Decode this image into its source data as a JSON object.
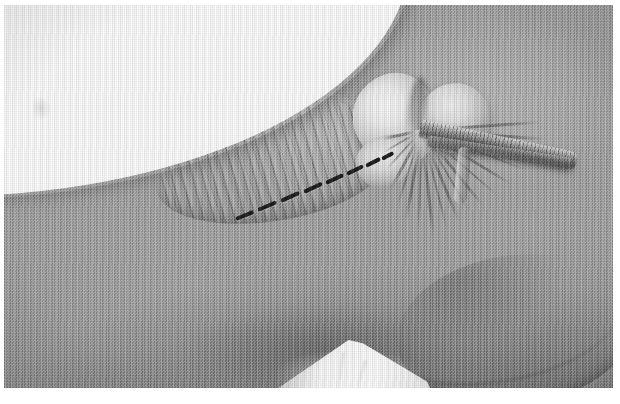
{
  "figure": {
    "domain": "Natural-Image",
    "caption_text": "",
    "orientation": "landscape",
    "rendering": "grayscale halftone print",
    "canvas": {
      "width": 620,
      "height": 404,
      "background": "#ffffff"
    },
    "plate": {
      "x": 4,
      "y": 5,
      "width": 609,
      "height": 383,
      "base_color": "#9d9d9d"
    }
  },
  "palette": {
    "paper_white": "#ffffff",
    "bone_highlight": "#fbfbfb",
    "tissue_light": "#c8c8c8",
    "tissue_mid": "#9d9d9d",
    "tissue_dark": "#6f6f6f",
    "shadow": "#4a4a4a",
    "incision_ink": "#1d1d1d",
    "drape_white": "#ffffff"
  },
  "regions": [
    {
      "name": "exposed-corner",
      "label": "blank white upper-left corner",
      "x": 0,
      "y": 0,
      "width": 330,
      "height": 225,
      "tone": "#ffffff"
    },
    {
      "name": "muscle-belly",
      "label": "striated muscle wing",
      "x": 150,
      "y": 74,
      "width": 230,
      "height": 120,
      "tone": "#a8a8a8",
      "feature": "parallel fiber striations running upper-left to lower-right"
    },
    {
      "name": "condyle-medial",
      "label": "bright bone condyle (left lobe)",
      "x": 349,
      "y": 68,
      "width": 84,
      "height": 92,
      "tone": "#fbfbfb"
    },
    {
      "name": "condyle-lateral",
      "label": "bright bone condyle (right lobe)",
      "x": 414,
      "y": 78,
      "width": 72,
      "height": 70,
      "tone": "#e2e2e2"
    },
    {
      "name": "intercondylar-notch",
      "label": "dark notch between condyles",
      "x": 404,
      "y": 72,
      "width": 18,
      "height": 62,
      "tone": "#565656"
    },
    {
      "name": "ligament-fan",
      "label": "radiating ligament fibers",
      "origin_x": 418,
      "origin_y": 124,
      "tone": "#5c5c5c"
    },
    {
      "name": "tendon-band",
      "label": "oblique tendon / graft strip",
      "x": 416,
      "y": 114,
      "width": 160,
      "height": 19,
      "tone": "#4a4a4a"
    },
    {
      "name": "lower-crease",
      "label": "sweeping curved shadow crease, lower right",
      "x": 372,
      "y": 244,
      "width": 250,
      "height": 132,
      "tone": "#4e4e4e"
    },
    {
      "name": "surgical-drape",
      "label": "white cloth drape peak at bottom",
      "x": 252,
      "y": 333,
      "width": 178,
      "height": 58,
      "peak_x": 345,
      "peak_y": 345,
      "tone": "#ffffff"
    }
  ],
  "incision": {
    "name": "dashed-incision-line",
    "label": "dashed surgical incision marker",
    "ink": "#1d1d1d",
    "start": {
      "x": 232,
      "y": 212
    },
    "end": {
      "x": 366,
      "y": 150
    },
    "dash_count": 8,
    "dash_length_px": 20,
    "dash_thickness_px": 4,
    "angle_deg": -25,
    "dashes": [
      {
        "x": 6,
        "y": 72,
        "angle": -22,
        "len": 19
      },
      {
        "x": 28,
        "y": 63,
        "angle": -23,
        "len": 20
      },
      {
        "x": 51,
        "y": 54,
        "angle": -24,
        "len": 20
      },
      {
        "x": 74,
        "y": 45,
        "angle": -25,
        "len": 20
      },
      {
        "x": 96,
        "y": 36,
        "angle": -25,
        "len": 19
      },
      {
        "x": 117,
        "y": 27,
        "angle": -26,
        "len": 18
      },
      {
        "x": 136,
        "y": 19,
        "angle": -27,
        "len": 16
      },
      {
        "x": 152,
        "y": 12,
        "angle": -28,
        "len": 13
      }
    ]
  },
  "fan_rays": [
    {
      "angle": -4,
      "len": 118,
      "thin": false
    },
    {
      "angle": 4,
      "len": 124,
      "thin": false
    },
    {
      "angle": 12,
      "len": 132,
      "thin": false
    },
    {
      "angle": 21,
      "len": 112,
      "thin": true
    },
    {
      "angle": 31,
      "len": 104,
      "thin": false
    },
    {
      "angle": 41,
      "len": 100,
      "thin": true
    },
    {
      "angle": 51,
      "len": 96,
      "thin": false
    },
    {
      "angle": 60,
      "len": 94,
      "thin": true
    },
    {
      "angle": 68,
      "len": 98,
      "thin": false
    },
    {
      "angle": 76,
      "len": 102,
      "thin": true
    },
    {
      "angle": 84,
      "len": 106,
      "thin": false
    },
    {
      "angle": 92,
      "len": 100,
      "thin": true
    },
    {
      "angle": 100,
      "len": 92,
      "thin": false
    },
    {
      "angle": 108,
      "len": 80,
      "thin": true
    },
    {
      "angle": 118,
      "len": 66,
      "thin": false
    },
    {
      "angle": 132,
      "len": 52,
      "thin": true
    },
    {
      "angle": 150,
      "len": 44,
      "thin": true
    },
    {
      "angle": 168,
      "len": 40,
      "thin": false
    }
  ],
  "texture": {
    "halftone": true,
    "vertical_scan_lines": true,
    "vignette": true,
    "grain_opacity": 0.3
  }
}
